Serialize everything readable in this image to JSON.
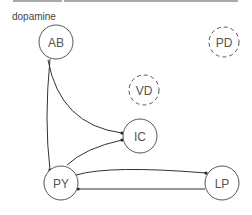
{
  "header": {
    "title": "dopamine"
  },
  "diagram": {
    "colors": {
      "stroke": "#555555",
      "edge": "#333333",
      "label": "#555555"
    },
    "nodes": [
      {
        "id": "AB",
        "label": "AB",
        "style": "solid"
      },
      {
        "id": "PD",
        "label": "PD",
        "style": "dashed"
      },
      {
        "id": "VD",
        "label": "VD",
        "style": "dashed"
      },
      {
        "id": "IC",
        "label": "IC",
        "style": "solid"
      },
      {
        "id": "PY",
        "label": "PY",
        "style": "solid"
      },
      {
        "id": "LP",
        "label": "LP",
        "style": "solid"
      }
    ],
    "edges": [
      {
        "from": "AB",
        "to": "PY"
      },
      {
        "from": "AB",
        "to": "IC"
      },
      {
        "from": "PY",
        "to": "IC"
      },
      {
        "from": "PY",
        "to": "LP"
      },
      {
        "from": "LP",
        "to": "PY"
      }
    ]
  }
}
